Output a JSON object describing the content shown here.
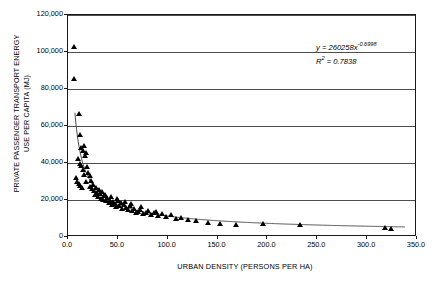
{
  "chart_data": {
    "type": "scatter",
    "title": "",
    "xlabel": "URBAN DENSITY (PERSONS PER HA)",
    "ylabel": "PRIVATE PASSENGER TRANSPORT ENERGY USE PER CAPITA (MJ)",
    "ylabel_line1": "PRIVATE PASSENGER TRANSPORT ENERGY",
    "ylabel_line2": "USE PER CAPITA (MJ)",
    "xlim": [
      0,
      350
    ],
    "ylim": [
      0,
      120000
    ],
    "xticks": [
      0,
      50,
      100,
      150,
      200,
      250,
      300,
      350
    ],
    "xtick_labels": [
      "0.0",
      "50.0",
      "100.0",
      "150.0",
      "200.0",
      "250.0",
      "300.0",
      "350.0"
    ],
    "yticks": [
      0,
      20000,
      40000,
      60000,
      80000,
      100000,
      120000
    ],
    "ytick_labels": [
      "0",
      "20,000",
      "40,000",
      "60,000",
      "80,000",
      "100,000",
      "120,000"
    ],
    "grid": "horizontal",
    "legend": "none",
    "annotations": {
      "equation": "y = 260258x",
      "equation_exponent": "-0.6998",
      "r_squared_label": "R",
      "r_squared_exponent": "2",
      "r_squared_value": " = 0.7838"
    },
    "marker": {
      "shape": "triangle",
      "color": "#000000",
      "size": 5
    },
    "fit_curve": {
      "type": "power",
      "coefficient": 260258,
      "exponent": -0.6998,
      "color": "#4d4d4d"
    },
    "points": [
      [
        5.8,
        103000
      ],
      [
        6.5,
        85500
      ],
      [
        11.0,
        67000
      ],
      [
        12.2,
        55500
      ],
      [
        13.5,
        48500
      ],
      [
        14.8,
        47000
      ],
      [
        16.0,
        49500
      ],
      [
        17.2,
        44000
      ],
      [
        18.5,
        45500
      ],
      [
        10.5,
        42500
      ],
      [
        12.0,
        40000
      ],
      [
        13.0,
        38500
      ],
      [
        15.5,
        36500
      ],
      [
        16.5,
        34000
      ],
      [
        19.0,
        38000
      ],
      [
        20.5,
        35000
      ],
      [
        21.8,
        33500
      ],
      [
        23.0,
        30500
      ],
      [
        8.5,
        32000
      ],
      [
        9.5,
        30000
      ],
      [
        10.8,
        29000
      ],
      [
        12.5,
        28000
      ],
      [
        14.0,
        26500
      ],
      [
        18.0,
        30000
      ],
      [
        22.0,
        27500
      ],
      [
        24.5,
        26000
      ],
      [
        26.0,
        25000
      ],
      [
        27.5,
        23000
      ],
      [
        29.0,
        24000
      ],
      [
        30.5,
        22000
      ],
      [
        32.0,
        23500
      ],
      [
        33.5,
        21000
      ],
      [
        35.0,
        20500
      ],
      [
        36.5,
        22500
      ],
      [
        38.0,
        19500
      ],
      [
        39.5,
        21500
      ],
      [
        41.0,
        18500
      ],
      [
        42.5,
        20000
      ],
      [
        44.0,
        17500
      ],
      [
        45.5,
        19000
      ],
      [
        47.0,
        18000
      ],
      [
        48.5,
        16500
      ],
      [
        50.0,
        19500
      ],
      [
        51.5,
        17000
      ],
      [
        53.0,
        18500
      ],
      [
        54.5,
        15500
      ],
      [
        56.0,
        17500
      ],
      [
        58.0,
        16000
      ],
      [
        60.0,
        15000
      ],
      [
        62.0,
        17000
      ],
      [
        64.0,
        14500
      ],
      [
        66.0,
        15500
      ],
      [
        68.0,
        13500
      ],
      [
        70.0,
        14000
      ],
      [
        72.0,
        15000
      ],
      [
        75.0,
        12500
      ],
      [
        78.0,
        13500
      ],
      [
        80.0,
        14500
      ],
      [
        83.0,
        12000
      ],
      [
        86.0,
        13000
      ],
      [
        90.0,
        11500
      ],
      [
        94.0,
        12500
      ],
      [
        98.0,
        11000
      ],
      [
        103.0,
        12000
      ],
      [
        108.0,
        10000
      ],
      [
        113.0,
        10500
      ],
      [
        120.0,
        9500
      ],
      [
        128.0,
        9000
      ],
      [
        140.0,
        8000
      ],
      [
        152.0,
        7500
      ],
      [
        168.0,
        7000
      ],
      [
        196.0,
        7500
      ],
      [
        233.0,
        7000
      ],
      [
        318.0,
        5000
      ],
      [
        324.0,
        4500
      ],
      [
        25.0,
        28500
      ],
      [
        28.0,
        26500
      ],
      [
        31.0,
        25500
      ],
      [
        34.0,
        24500
      ],
      [
        37.0,
        23000
      ],
      [
        43.0,
        22000
      ],
      [
        49.0,
        21000
      ],
      [
        57.0,
        19000
      ],
      [
        63.0,
        18000
      ],
      [
        73.0,
        16500
      ],
      [
        88.0,
        14000
      ]
    ]
  }
}
